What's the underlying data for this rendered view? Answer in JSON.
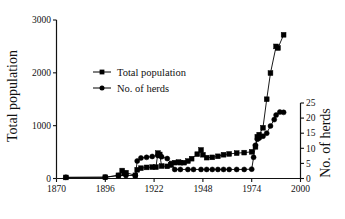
{
  "chart_data": {
    "type": "line",
    "title": "",
    "xlabel": "",
    "ylabel": "Total population",
    "ylabel_secondary": "No. of herds",
    "xlim": [
      1870,
      2000
    ],
    "ylim": [
      0,
      3000
    ],
    "ylim_secondary": [
      0,
      25
    ],
    "xticks": [
      1870,
      1896,
      1922,
      1948,
      1974,
      2000
    ],
    "xticklabels": [
      "1870",
      "1896",
      "1922",
      "1948",
      "1974",
      "2000"
    ],
    "yticks": [
      0,
      1000,
      2000,
      3000
    ],
    "yticklabels": [
      "0",
      "1000",
      "2000",
      "3000"
    ],
    "yticks_secondary": [
      0,
      5,
      10,
      15,
      20,
      25
    ],
    "yticklabels_secondary": [
      "0",
      "5",
      "10",
      "15",
      "20",
      "25"
    ],
    "grid": false,
    "legend_position": "upper left",
    "series": [
      {
        "name": "Total population",
        "axis": "left",
        "marker": "square",
        "color": "#000000",
        "points": [
          [
            1875,
            20
          ],
          [
            1896,
            25
          ],
          [
            1903,
            60
          ],
          [
            1905,
            150
          ],
          [
            1906,
            95
          ],
          [
            1907,
            110
          ],
          [
            1912,
            60
          ],
          [
            1913,
            165
          ],
          [
            1915,
            195
          ],
          [
            1918,
            210
          ],
          [
            1921,
            215
          ],
          [
            1923,
            215
          ],
          [
            1924,
            480
          ],
          [
            1925,
            455
          ],
          [
            1926,
            235
          ],
          [
            1929,
            230
          ],
          [
            1931,
            255
          ],
          [
            1933,
            300
          ],
          [
            1935,
            310
          ],
          [
            1936,
            300
          ],
          [
            1938,
            300
          ],
          [
            1940,
            330
          ],
          [
            1942,
            375
          ],
          [
            1945,
            460
          ],
          [
            1947,
            540
          ],
          [
            1948,
            450
          ],
          [
            1950,
            395
          ],
          [
            1953,
            400
          ],
          [
            1956,
            420
          ],
          [
            1959,
            450
          ],
          [
            1962,
            465
          ],
          [
            1966,
            480
          ],
          [
            1970,
            490
          ],
          [
            1974,
            505
          ],
          [
            1976,
            600
          ],
          [
            1977,
            790
          ],
          [
            1978,
            830
          ],
          [
            1980,
            960
          ],
          [
            1982,
            1500
          ],
          [
            1984,
            1995
          ],
          [
            1987,
            2500
          ],
          [
            1988,
            2470
          ],
          [
            1991,
            2720
          ]
        ]
      },
      {
        "name": "No. of herds",
        "axis": "right",
        "marker": "circle",
        "color": "#000000",
        "points": [
          [
            1875,
            0.4
          ],
          [
            1896,
            0.4
          ],
          [
            1903,
            1.0
          ],
          [
            1907,
            1.0
          ],
          [
            1912,
            1.0
          ],
          [
            1913,
            5.8
          ],
          [
            1915,
            6.8
          ],
          [
            1918,
            7.0
          ],
          [
            1921,
            7.3
          ],
          [
            1924,
            7.6
          ],
          [
            1925,
            7.6
          ],
          [
            1926,
            7.2
          ],
          [
            1929,
            6.6
          ],
          [
            1931,
            5.0
          ],
          [
            1933,
            3.0
          ],
          [
            1936,
            3.0
          ],
          [
            1940,
            3.0
          ],
          [
            1943,
            3.0
          ],
          [
            1947,
            3.0
          ],
          [
            1950,
            3.0
          ],
          [
            1953,
            3.0
          ],
          [
            1956,
            3.0
          ],
          [
            1959,
            3.0
          ],
          [
            1962,
            3.0
          ],
          [
            1966,
            3.0
          ],
          [
            1970,
            3.0
          ],
          [
            1974,
            3.1
          ],
          [
            1975,
            7.0
          ],
          [
            1976,
            11.0
          ],
          [
            1977,
            13.0
          ],
          [
            1978,
            13.4
          ],
          [
            1980,
            14.0
          ],
          [
            1982,
            15.0
          ],
          [
            1984,
            17.4
          ],
          [
            1986,
            19.5
          ],
          [
            1987,
            21.0
          ],
          [
            1989,
            22.0
          ],
          [
            1991,
            21.9
          ]
        ]
      }
    ]
  },
  "legend": {
    "items": [
      {
        "label": "Total population",
        "marker": "square"
      },
      {
        "label": "No. of herds",
        "marker": "circle"
      }
    ]
  },
  "caption": ""
}
